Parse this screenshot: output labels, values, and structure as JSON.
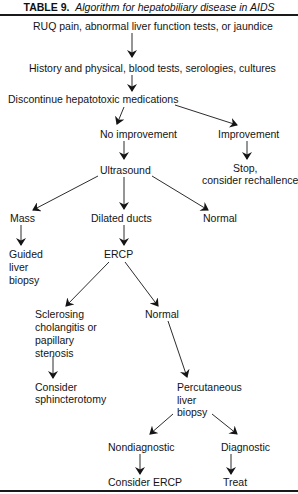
{
  "title": {
    "label": "TABLE 9.",
    "text": "Algorithm for hepatobiliary disease in AIDS"
  },
  "nodes": {
    "start": "RUQ pain, abnormal liver function tests, or jaundice",
    "history": "History and physical, blood tests, serologies, cultures",
    "discontinue": "Discontinue hepatotoxic medications",
    "no_improvement": "No improvement",
    "improvement": "Improvement",
    "stop_line1": "Stop,",
    "stop_line2": "consider rechallence",
    "ultrasound": "Ultrasound",
    "mass": "Mass",
    "dilated_ducts": "Dilated ducts",
    "normal_us": "Normal",
    "guided_line1": "Guided",
    "guided_line2": "liver",
    "guided_line3": "biopsy",
    "ercp": "ERCP",
    "sclerosing_line1": "Sclerosing",
    "sclerosing_line2": "cholangitis or",
    "sclerosing_line3": "papillary",
    "sclerosing_line4": "stenosis",
    "normal_ercp": "Normal",
    "sphincter_line1": "Consider",
    "sphincter_line2": "sphincterotomy",
    "percutaneous_line1": "Percutaneous",
    "percutaneous_line2": "liver",
    "percutaneous_line3": "biopsy",
    "nondiagnostic": "Nondiagnostic",
    "diagnostic": "Diagnostic",
    "consider_ercp": "Consider ERCP",
    "treat": "Treat"
  },
  "edges": [
    [
      "start",
      "history"
    ],
    [
      "history",
      "discontinue"
    ],
    [
      "discontinue",
      "no_improvement"
    ],
    [
      "discontinue",
      "improvement"
    ],
    [
      "improvement",
      "stop"
    ],
    [
      "no_improvement",
      "ultrasound"
    ],
    [
      "ultrasound",
      "mass"
    ],
    [
      "ultrasound",
      "dilated_ducts"
    ],
    [
      "ultrasound",
      "normal_us"
    ],
    [
      "mass",
      "guided_liver_biopsy"
    ],
    [
      "dilated_ducts",
      "ercp"
    ],
    [
      "ercp",
      "sclerosing"
    ],
    [
      "ercp",
      "normal_ercp"
    ],
    [
      "sclerosing",
      "consider_sphincterotomy"
    ],
    [
      "normal_ercp",
      "percutaneous_liver_biopsy"
    ],
    [
      "percutaneous_liver_biopsy",
      "nondiagnostic"
    ],
    [
      "percutaneous_liver_biopsy",
      "diagnostic"
    ],
    [
      "nondiagnostic",
      "consider_ercp"
    ],
    [
      "diagnostic",
      "treat"
    ]
  ],
  "colors": {
    "ink": "#141414",
    "background": "#ffffff"
  }
}
